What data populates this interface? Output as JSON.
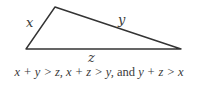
{
  "diagram": {
    "type": "triangle",
    "vertices": [
      [
        26,
        49
      ],
      [
        55,
        7
      ],
      [
        181,
        49
      ]
    ],
    "stroke_color": "#333333",
    "sides": [
      {
        "name": "x",
        "label": "x",
        "from": 0,
        "to": 1
      },
      {
        "name": "y",
        "label": "y",
        "from": 1,
        "to": 2
      },
      {
        "name": "z",
        "label": "z",
        "from": 0,
        "to": 2
      }
    ]
  },
  "caption": {
    "part1": "x + y > z,",
    "part2": "x + z > y,",
    "and": "and",
    "part3": "y + z > x"
  }
}
